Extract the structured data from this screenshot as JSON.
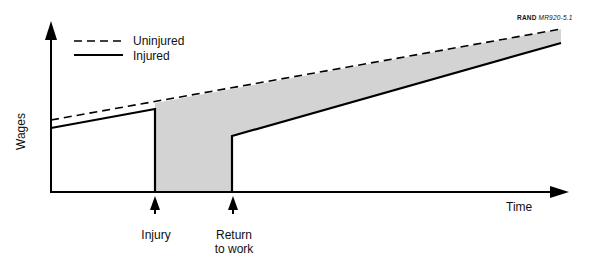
{
  "figure": {
    "credit_org": "RAND",
    "credit_id": "MR920-5.1",
    "y_axis_label": "Wages",
    "x_axis_label": "Time",
    "legend": [
      {
        "label": "Uninjured",
        "style": "dashed"
      },
      {
        "label": "Injured",
        "style": "solid"
      }
    ],
    "annotations": [
      {
        "label": "Injury"
      },
      {
        "label_line1": "Return",
        "label_line2": "to work"
      }
    ],
    "colors": {
      "line": "#000000",
      "shaded_loss": "#d3d3d3",
      "background": "#ffffff"
    }
  }
}
